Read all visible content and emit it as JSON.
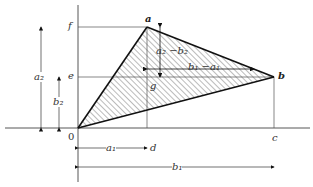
{
  "diagram": {
    "points": {
      "O": {
        "label": "0",
        "x": 78,
        "y": 128
      },
      "a": {
        "label": "a",
        "x": 147,
        "y": 27
      },
      "b": {
        "label": "b",
        "x": 274,
        "y": 77
      },
      "c": {
        "label": "c",
        "x": 274,
        "y": 128
      },
      "d": {
        "label": "d",
        "x": 147,
        "y": 128
      },
      "e": {
        "label": "e",
        "x": 78,
        "y": 77
      },
      "f": {
        "label": "f",
        "x": 78,
        "y": 27
      },
      "g": {
        "label": "g",
        "x": 147,
        "y": 77
      }
    },
    "dimensions": {
      "a2": "a₂",
      "b2": "b₂",
      "a1": "a₁",
      "b1": "b₁",
      "a2_minus_b2": "a₂ −b₂",
      "b1_minus_a1": "b₁ −a₁"
    },
    "colors": {
      "line": "#222222",
      "hatch": "#555555",
      "background": "#ffffff"
    }
  }
}
